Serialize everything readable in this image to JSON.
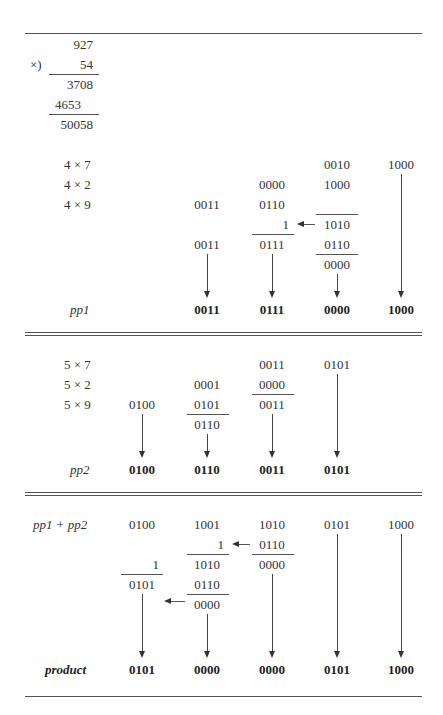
{
  "decimal": {
    "multiplicand": "927",
    "op": "×)",
    "multiplier": "54",
    "partial1": "3708",
    "partial2": "4653",
    "result": "50058"
  },
  "pp1_section": {
    "rows": [
      {
        "label": "4 × 7",
        "c3": "0010",
        "c4": "1000"
      },
      {
        "label": "4 × 2",
        "c2": "0000",
        "c3": "1000"
      },
      {
        "label": "4 × 9",
        "c1": "0011",
        "c2": "0110"
      }
    ],
    "carry_c2": "1",
    "sum_c3": "1010",
    "sum_c1": "0011",
    "sum_c2": "0111",
    "corr_c3": "0110",
    "corr_res_c3": "0000",
    "result_label": "pp1",
    "result": [
      "0011",
      "0111",
      "0000",
      "1000"
    ]
  },
  "pp2_section": {
    "rows": [
      {
        "label": "5 × 7",
        "c2": "0011",
        "c3": "0101"
      },
      {
        "label": "5 × 2",
        "c1": "0001",
        "c2": "0000"
      },
      {
        "label": "5 × 9",
        "c0": "0100",
        "c1": "0101",
        "c2": "0011"
      }
    ],
    "sum_c1": "0110",
    "result_label": "pp2",
    "result": [
      "0100",
      "0110",
      "0011",
      "0101"
    ]
  },
  "product_section": {
    "label": "pp1 + pp2",
    "top": [
      "0100",
      "1001",
      "1010",
      "0101",
      "1000"
    ],
    "carry_c1": "1",
    "corr_c2": "0110",
    "sum_c1": "1010",
    "sum_c2": "0000",
    "carry_c0": "1",
    "sum_c0": "0101",
    "corr_c1": "0110",
    "corr_res_c1": "0000",
    "result_label": "product",
    "result": [
      "0101",
      "0000",
      "0000",
      "0101",
      "1000"
    ]
  }
}
